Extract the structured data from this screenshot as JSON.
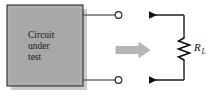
{
  "figure": {
    "type": "circuit-diagram",
    "background_color": "#ffffff",
    "block": {
      "label_lines": [
        "Circuit",
        "under",
        "test"
      ],
      "fill_color": "#a8a8a8",
      "border_color": "#3c3c3c",
      "shadow_color": "#c9c9c9"
    },
    "terminals": {
      "top_label": "",
      "bottom_label": "",
      "marker": "open-circle",
      "color": "#2b2b2b"
    },
    "transition_arrow": {
      "direction": "right",
      "color": "#b6b6b6",
      "outline_color": "#9a9a9a"
    },
    "load_circuit": {
      "resistor_label_symbol": "R",
      "resistor_label_subscript": "L",
      "current_arrow_top": "right",
      "current_arrow_bottom": "right",
      "wire_color": "#1e1e1e"
    }
  }
}
